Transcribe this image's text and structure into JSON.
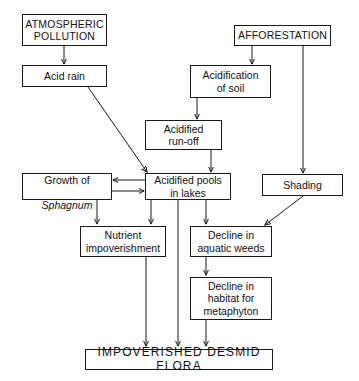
{
  "diagram": {
    "background_color": "#ffffff",
    "line_color": "#1a1a1a",
    "nodes": [
      {
        "id": "atmospheric-pollution",
        "label": "ATMOSPHERIC\nPOLLUTION",
        "style": "caps"
      },
      {
        "id": "afforestation",
        "label": "AFFORESTATION",
        "style": "caps"
      },
      {
        "id": "acid-rain",
        "label": "Acid rain",
        "style": "normal"
      },
      {
        "id": "acidification-of-soil",
        "label": "Acidification\nof soil",
        "style": "normal"
      },
      {
        "id": "acidified-run-off",
        "label": "Acidified\nrun-off",
        "style": "normal"
      },
      {
        "id": "growth-of-sphagnum",
        "label_line1": "Growth of",
        "label_line2": "Sphagnum",
        "style": "normal-italic-second-line"
      },
      {
        "id": "acidified-pools-in-lakes",
        "label": "Acidified pools\nin lakes",
        "style": "normal"
      },
      {
        "id": "shading",
        "label": "Shading",
        "style": "normal"
      },
      {
        "id": "nutrient-impoverishment",
        "label": "Nutrient\nimpoverishment",
        "style": "normal"
      },
      {
        "id": "decline-in-aquatic-weeds",
        "label": "Decline in\naquatic weeds",
        "style": "normal"
      },
      {
        "id": "decline-in-habitat-for-metaphyton",
        "label": "Decline in\nhabitat for\nmetaphyton",
        "style": "normal"
      },
      {
        "id": "impoverished-desmid-flora",
        "label": "IMPOVERISHED  DESMID  FLORA",
        "style": "big-caps"
      }
    ],
    "edges": [
      {
        "from": "atmospheric-pollution",
        "to": "acid-rain",
        "kind": "straight-down"
      },
      {
        "from": "acid-rain",
        "to": "acidified-pools-in-lakes",
        "kind": "diagonal"
      },
      {
        "from": "afforestation",
        "to": "acidification-of-soil",
        "kind": "straight-down"
      },
      {
        "from": "afforestation",
        "to": "shading",
        "kind": "straight-down"
      },
      {
        "from": "acidification-of-soil",
        "to": "acidified-run-off",
        "kind": "straight-down"
      },
      {
        "from": "acidified-run-off",
        "to": "acidified-pools-in-lakes",
        "kind": "straight-down"
      },
      {
        "from": "acidified-pools-in-lakes",
        "to": "growth-of-sphagnum",
        "kind": "left-arrow"
      },
      {
        "from": "growth-of-sphagnum",
        "to": "acidified-pools-in-lakes",
        "kind": "right-arrow"
      },
      {
        "from": "growth-of-sphagnum",
        "to": "nutrient-impoverishment",
        "kind": "straight-down"
      },
      {
        "from": "acidified-pools-in-lakes",
        "to": "nutrient-impoverishment",
        "kind": "straight-down"
      },
      {
        "from": "acidified-pools-in-lakes",
        "to": "decline-in-aquatic-weeds",
        "kind": "straight-down"
      },
      {
        "from": "acidified-pools-in-lakes",
        "to": "impoverished-desmid-flora",
        "kind": "long-straight-down"
      },
      {
        "from": "shading",
        "to": "decline-in-aquatic-weeds",
        "kind": "diagonal"
      },
      {
        "from": "decline-in-aquatic-weeds",
        "to": "decline-in-habitat-for-metaphyton",
        "kind": "straight-down"
      },
      {
        "from": "nutrient-impoverishment",
        "to": "impoverished-desmid-flora",
        "kind": "long-straight-down"
      },
      {
        "from": "decline-in-habitat-for-metaphyton",
        "to": "impoverished-desmid-flora",
        "kind": "straight-down"
      }
    ]
  }
}
